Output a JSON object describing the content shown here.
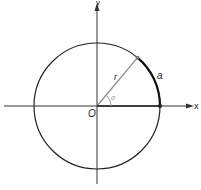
{
  "diagram": {
    "labels": {
      "x_axis": "x",
      "y_axis": "y",
      "origin": "O",
      "radius": "r",
      "arc": "a",
      "angle": "α"
    },
    "colors": {
      "axis": "#333333",
      "circle": "#222222",
      "radius": "#888888",
      "arc": "#111111",
      "angle_mark": "#999999"
    },
    "geometry": {
      "center": [
        97,
        106
      ],
      "radius_px": 63,
      "angle_deg": 50
    }
  }
}
